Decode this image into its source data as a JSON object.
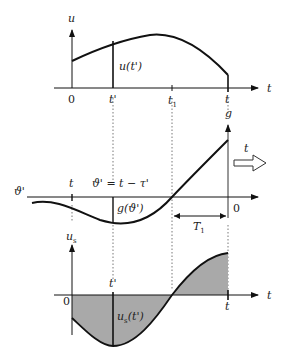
{
  "colors": {
    "ink": "#111111",
    "fill": "#a9a9a9",
    "guide": "#555555"
  },
  "top_panel": {
    "y_axis_label": "u",
    "x_axis_label": "t",
    "curve_label": "u(t')",
    "ticks": [
      "0",
      "t'",
      "t1",
      "t"
    ]
  },
  "middle_panel": {
    "y_axis_label": "g",
    "left_label": "ϑ'",
    "tick_t_label": "t",
    "equation_label": "ϑ' = t − τ'",
    "curve_label": "g(ϑ')",
    "origin_label": "0",
    "interval_label": "T1",
    "shift_arrow_label": "t"
  },
  "bottom_panel": {
    "y_axis_label": "u_s",
    "x_axis_label": "t",
    "origin_label": "0",
    "tick_top_label": "t'",
    "tick_end_label": "t",
    "curve_label": "u_s(t')"
  }
}
